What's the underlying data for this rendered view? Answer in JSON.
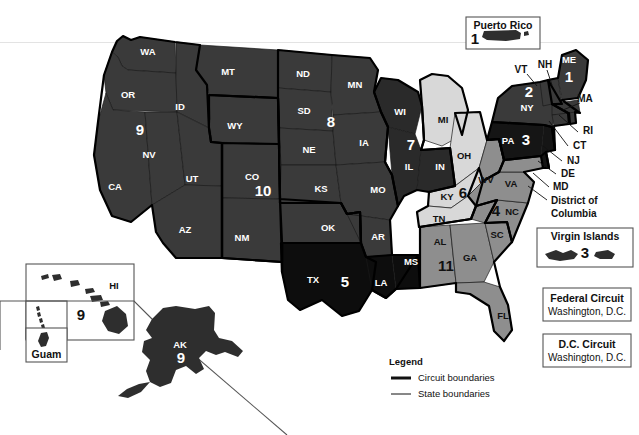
{
  "map": {
    "title_text": "",
    "palette": {
      "c1": "#3a3a3a",
      "c2": "#3a3a3a",
      "c3": "#151515",
      "c4": "#8e8e8e",
      "c5": "#0d0d0d",
      "c6": "#d8d8d8",
      "c7": "#2a2a2a",
      "c8": "#3a3a3a",
      "c9": "#3a3a3a",
      "c10": "#3a3a3a",
      "c11": "#8e8e8e",
      "boundary": "#000000",
      "state_line": "#1a1a1a",
      "background": "#ffffff"
    },
    "states": [
      {
        "code": "WA",
        "circuit": 9,
        "label": "WA",
        "x": 148,
        "y": 52
      },
      {
        "code": "OR",
        "circuit": 9,
        "label": "OR",
        "x": 128,
        "y": 95
      },
      {
        "code": "ID",
        "circuit": 9,
        "label": "ID",
        "x": 180,
        "y": 107
      },
      {
        "code": "MT",
        "circuit": 9,
        "label": "MT",
        "x": 228,
        "y": 72
      },
      {
        "code": "WY",
        "circuit": 10,
        "label": "WY",
        "x": 235,
        "y": 126
      },
      {
        "code": "NV",
        "circuit": 9,
        "label": "NV",
        "x": 149,
        "y": 155
      },
      {
        "code": "CA",
        "circuit": 9,
        "label": "CA",
        "x": 115,
        "y": 187
      },
      {
        "code": "UT",
        "circuit": 10,
        "label": "UT",
        "x": 192,
        "y": 179
      },
      {
        "code": "AZ",
        "circuit": 9,
        "label": "AZ",
        "x": 185,
        "y": 230
      },
      {
        "code": "NM",
        "circuit": 10,
        "label": "NM",
        "x": 242,
        "y": 238
      },
      {
        "code": "CO",
        "circuit": 10,
        "label": "CO",
        "x": 252,
        "y": 177
      },
      {
        "code": "ND",
        "circuit": 8,
        "label": "ND",
        "x": 303,
        "y": 74
      },
      {
        "code": "SD",
        "circuit": 8,
        "label": "SD",
        "x": 304,
        "y": 111
      },
      {
        "code": "NE",
        "circuit": 8,
        "label": "NE",
        "x": 309,
        "y": 150
      },
      {
        "code": "KS",
        "circuit": 10,
        "label": "KS",
        "x": 321,
        "y": 189
      },
      {
        "code": "OK",
        "circuit": 10,
        "label": "OK",
        "x": 328,
        "y": 228
      },
      {
        "code": "TX",
        "circuit": 5,
        "label": "TX",
        "x": 313,
        "y": 280
      },
      {
        "code": "MN",
        "circuit": 8,
        "label": "MN",
        "x": 355,
        "y": 85
      },
      {
        "code": "IA",
        "circuit": 8,
        "label": "IA",
        "x": 364,
        "y": 143
      },
      {
        "code": "MO",
        "circuit": 8,
        "label": "MO",
        "x": 378,
        "y": 190
      },
      {
        "code": "AR",
        "circuit": 8,
        "label": "AR",
        "x": 378,
        "y": 237
      },
      {
        "code": "LA",
        "circuit": 5,
        "label": "LA",
        "x": 381,
        "y": 283
      },
      {
        "code": "MS",
        "circuit": 5,
        "label": "MS",
        "x": 411,
        "y": 262
      },
      {
        "code": "WI",
        "circuit": 7,
        "label": "WI",
        "x": 400,
        "y": 112
      },
      {
        "code": "IL",
        "circuit": 7,
        "label": "IL",
        "x": 409,
        "y": 167
      },
      {
        "code": "IN",
        "circuit": 7,
        "label": "IN",
        "x": 440,
        "y": 167
      },
      {
        "code": "MI",
        "circuit": 6,
        "label": "MI",
        "x": 443,
        "y": 120
      },
      {
        "code": "OH",
        "circuit": 6,
        "label": "OH",
        "x": 464,
        "y": 156
      },
      {
        "code": "KY",
        "circuit": 6,
        "label": "KY",
        "x": 447,
        "y": 197
      },
      {
        "code": "TN",
        "circuit": 6,
        "label": "TN",
        "x": 439,
        "y": 219
      },
      {
        "code": "AL",
        "circuit": 11,
        "label": "AL",
        "x": 440,
        "y": 242
      },
      {
        "code": "GA",
        "circuit": 11,
        "label": "GA",
        "x": 470,
        "y": 258
      },
      {
        "code": "FL",
        "circuit": 11,
        "label": "FL",
        "x": 503,
        "y": 316
      },
      {
        "code": "SC",
        "circuit": 4,
        "label": "SC",
        "x": 497,
        "y": 235
      },
      {
        "code": "NC",
        "circuit": 4,
        "label": "NC",
        "x": 512,
        "y": 212
      },
      {
        "code": "VA",
        "circuit": 4,
        "label": "VA",
        "x": 511,
        "y": 184
      },
      {
        "code": "WV",
        "circuit": 4,
        "label": "WV",
        "x": 486,
        "y": 180
      },
      {
        "code": "PA",
        "circuit": 3,
        "label": "PA",
        "x": 508,
        "y": 141
      },
      {
        "code": "NY",
        "circuit": 2,
        "label": "NY",
        "x": 527,
        "y": 108
      },
      {
        "code": "ME",
        "circuit": 1,
        "label": "ME",
        "x": 569,
        "y": 60
      },
      {
        "code": "VT",
        "circuit": 2,
        "label": "VT",
        "x": 521,
        "y": 70
      },
      {
        "code": "NH",
        "circuit": 1,
        "label": "NH",
        "x": 545,
        "y": 65
      },
      {
        "code": "MA",
        "circuit": 1,
        "label": "MA",
        "x": 585,
        "y": 99
      },
      {
        "code": "HI",
        "circuit": 9,
        "label": "HI",
        "x": 114,
        "y": 285
      },
      {
        "code": "AK",
        "circuit": 9,
        "label": "AK",
        "x": 180,
        "y": 345
      }
    ],
    "circuit_numbers": [
      {
        "circuit": "1",
        "x": 569,
        "y": 78
      },
      {
        "circuit": "2",
        "x": 529,
        "y": 93
      },
      {
        "circuit": "3",
        "x": 526,
        "y": 141
      },
      {
        "circuit": "4",
        "x": 496,
        "y": 212
      },
      {
        "circuit": "5",
        "x": 345,
        "y": 283
      },
      {
        "circuit": "6",
        "x": 463,
        "y": 194
      },
      {
        "circuit": "7",
        "x": 411,
        "y": 146
      },
      {
        "circuit": "8",
        "x": 331,
        "y": 123
      },
      {
        "circuit": "9",
        "x": 140,
        "y": 131
      },
      {
        "circuit": "10",
        "x": 263,
        "y": 192
      },
      {
        "circuit": "11",
        "x": 446,
        "y": 267
      },
      {
        "circuit": "9",
        "x": 80,
        "y": 316
      },
      {
        "circuit": "9",
        "x": 181,
        "y": 358
      }
    ],
    "leader_labels": [
      {
        "label": "RI",
        "x": 583,
        "y": 131,
        "lx1": 578,
        "ly1": 132,
        "lx2": 559,
        "ly2": 115
      },
      {
        "label": "CT",
        "x": 573,
        "y": 146,
        "lx1": 568,
        "ly1": 146,
        "lx2": 549,
        "ly2": 121
      },
      {
        "label": "NJ",
        "x": 567,
        "y": 161,
        "lx1": 562,
        "ly1": 161,
        "lx2": 543,
        "ly2": 146
      },
      {
        "label": "DE",
        "x": 561,
        "y": 174,
        "lx1": 556,
        "ly1": 174,
        "lx2": 538,
        "ly2": 161
      },
      {
        "label": "MD",
        "x": 553,
        "y": 187,
        "lx1": 549,
        "ly1": 187,
        "lx2": 533,
        "ly2": 173
      },
      {
        "label": "District of",
        "x": 551,
        "y": 201,
        "lx1": 547,
        "ly1": 200,
        "lx2": 528,
        "ly2": 186
      },
      {
        "label": "Columbia",
        "x": 551,
        "y": 214,
        "lx1": null,
        "ly1": null,
        "lx2": null,
        "ly2": null
      },
      {
        "label": "VT",
        "x": 521,
        "y": 70,
        "lx1": 527,
        "ly1": 74,
        "lx2": 537,
        "ly2": 86
      },
      {
        "label": "NH",
        "x": 545,
        "y": 65,
        "lx1": 547,
        "ly1": 70,
        "lx2": 552,
        "ly2": 85
      },
      {
        "label": "MA",
        "x": 585,
        "y": 99,
        "lx1": 580,
        "ly1": 103,
        "lx2": 563,
        "ly2": 110
      }
    ],
    "insets": [
      {
        "name": "puerto-rico",
        "title": "Puerto Rico",
        "circuit": "1",
        "x": 466,
        "y": 17,
        "w": 74,
        "h": 32
      },
      {
        "name": "virgin-islands",
        "title": "Virgin Islands",
        "circuit": "3",
        "x": 537,
        "y": 228,
        "w": 96,
        "h": 39
      },
      {
        "name": "hawaii",
        "title": "HI",
        "circuit": "9",
        "x": 26,
        "y": 264,
        "w": 108,
        "h": 76
      },
      {
        "name": "northern-mariana",
        "title": "",
        "circuit": "",
        "x": 26,
        "y": 301,
        "w": 41,
        "h": 38
      },
      {
        "name": "guam",
        "title": "Guam",
        "circuit": "",
        "x": 26,
        "y": 328,
        "w": 41,
        "h": 34
      },
      {
        "name": "alaska",
        "title": "AK",
        "circuit": "9",
        "x": 0,
        "y": 301,
        "w": 0,
        "h": 0
      }
    ],
    "court_boxes": [
      {
        "name": "federal-circuit",
        "title": "Federal Circuit",
        "sub": "Washington, D.C.",
        "x": 543,
        "y": 288,
        "w": 88,
        "h": 33
      },
      {
        "name": "dc-circuit",
        "title": "D.C. Circuit",
        "sub": "Washington, D.C.",
        "x": 543,
        "y": 334,
        "w": 88,
        "h": 33
      }
    ],
    "legend": {
      "title": "Legend",
      "x": 389,
      "y": 362,
      "items": [
        {
          "label": "Circuit boundaries",
          "style": "thick"
        },
        {
          "label": "State boundaries",
          "style": "thin"
        }
      ]
    }
  },
  "chart_data": {
    "type": "map",
    "series": [
      {
        "name": "1st Circuit",
        "number": 1,
        "members": [
          "ME",
          "NH",
          "MA",
          "RI",
          "Puerto Rico"
        ]
      },
      {
        "name": "2nd Circuit",
        "number": 2,
        "members": [
          "VT",
          "NY",
          "CT"
        ]
      },
      {
        "name": "3rd Circuit",
        "number": 3,
        "members": [
          "PA",
          "NJ",
          "DE",
          "Virgin Islands"
        ]
      },
      {
        "name": "4th Circuit",
        "number": 4,
        "members": [
          "MD",
          "WV",
          "VA",
          "NC",
          "SC"
        ]
      },
      {
        "name": "5th Circuit",
        "number": 5,
        "members": [
          "TX",
          "LA",
          "MS"
        ]
      },
      {
        "name": "6th Circuit",
        "number": 6,
        "members": [
          "MI",
          "OH",
          "KY",
          "TN"
        ]
      },
      {
        "name": "7th Circuit",
        "number": 7,
        "members": [
          "WI",
          "IL",
          "IN"
        ]
      },
      {
        "name": "8th Circuit",
        "number": 8,
        "members": [
          "ND",
          "SD",
          "MN",
          "NE",
          "IA",
          "MO",
          "AR"
        ]
      },
      {
        "name": "9th Circuit",
        "number": 9,
        "members": [
          "WA",
          "OR",
          "ID",
          "MT",
          "NV",
          "CA",
          "AZ",
          "AK",
          "HI",
          "Guam",
          "Northern Mariana Islands"
        ]
      },
      {
        "name": "10th Circuit",
        "number": 10,
        "members": [
          "WY",
          "UT",
          "CO",
          "NM",
          "KS",
          "OK"
        ]
      },
      {
        "name": "11th Circuit",
        "number": 11,
        "members": [
          "AL",
          "GA",
          "FL"
        ]
      },
      {
        "name": "Federal Circuit",
        "number": null,
        "members": [
          "Washington, D.C."
        ]
      },
      {
        "name": "D.C. Circuit",
        "number": null,
        "members": [
          "Washington, D.C."
        ]
      }
    ],
    "legend": [
      "Circuit boundaries",
      "State boundaries"
    ]
  }
}
